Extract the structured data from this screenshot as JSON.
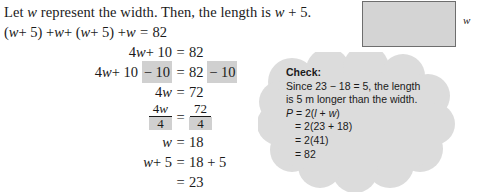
{
  "problem": {
    "intro_part1": "Let ",
    "intro_var": "w",
    "intro_part2": " represent the width. Then, the length is ",
    "intro_var2": "w",
    "intro_part3": " + 5."
  },
  "equations": [
    {
      "lhs": "(w + 5) + w + (w + 5) + w",
      "eq": "=",
      "rhs": "82",
      "lhs_highlight": "",
      "rhs_highlight": "",
      "style": "full-left"
    },
    {
      "lhs": "4w + 10",
      "eq": "=",
      "rhs": "82",
      "lhs_highlight": "",
      "rhs_highlight": "",
      "style": "plain"
    },
    {
      "lhs": "4w + 10",
      "eq": "=",
      "rhs": "82",
      "lhs_highlight": "− 10",
      "rhs_highlight": "− 10",
      "style": "highlighted"
    },
    {
      "lhs": "4w",
      "eq": "=",
      "rhs": "72",
      "lhs_highlight": "",
      "rhs_highlight": "",
      "style": "plain"
    },
    {
      "lhs_numerator": "4w",
      "lhs_denominator": "4",
      "eq": "=",
      "rhs_numerator": "72",
      "rhs_denominator": "4",
      "style": "fraction"
    },
    {
      "lhs": "w",
      "eq": "=",
      "rhs": "18",
      "lhs_highlight": "",
      "rhs_highlight": "",
      "style": "plain"
    },
    {
      "lhs": "w + 5",
      "eq": "=",
      "rhs": "18 + 5",
      "lhs_highlight": "",
      "rhs_highlight": "",
      "style": "plain"
    },
    {
      "lhs": "",
      "eq": "=",
      "rhs": "23",
      "lhs_highlight": "",
      "rhs_highlight": "",
      "style": "plain"
    }
  ],
  "figure": {
    "width_label": "w",
    "fill_color": "#d4d4d4",
    "border_color": "#6e6e6e"
  },
  "check": {
    "title": "Check:",
    "line1": "Since 23 − 18 = 5, the length",
    "line2": "is 5 m longer than the width.",
    "line3_prefix": "P",
    "line3_rest": " = 2(",
    "line3_var_l": "l",
    "line3_mid": " + ",
    "line3_var_w": "w",
    "line3_suffix": ")",
    "line4": "= 2(23 + 18)",
    "line5": "= 2(41)",
    "line6": "= 82",
    "cloud_fill": "#dcdcdc"
  }
}
